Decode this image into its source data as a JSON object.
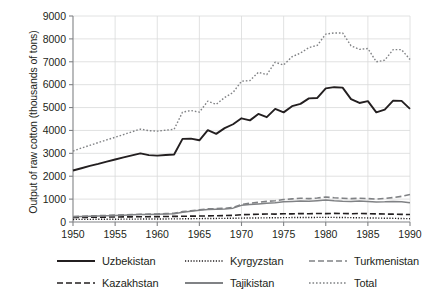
{
  "chart_data": {
    "type": "line",
    "title": "",
    "xlabel": "",
    "ylabel": "Output of raw cotton (thousands of tons)",
    "xlim": [
      1950,
      1990
    ],
    "ylim": [
      0,
      9000
    ],
    "grid": true,
    "legend_position": "bottom",
    "x": [
      1950,
      1951,
      1952,
      1953,
      1954,
      1955,
      1956,
      1957,
      1958,
      1959,
      1960,
      1961,
      1962,
      1963,
      1964,
      1965,
      1966,
      1967,
      1968,
      1969,
      1970,
      1971,
      1972,
      1973,
      1974,
      1975,
      1976,
      1977,
      1978,
      1979,
      1980,
      1981,
      1982,
      1983,
      1984,
      1985,
      1986,
      1987,
      1988,
      1989,
      1990
    ],
    "xticks": [
      1950,
      1955,
      1960,
      1965,
      1970,
      1975,
      1980,
      1985,
      1990
    ],
    "yticks": [
      0,
      1000,
      2000,
      3000,
      4000,
      5000,
      6000,
      7000,
      8000,
      9000
    ],
    "series": [
      {
        "name": "Uzbekistan",
        "style": "solid",
        "color": "#231f20",
        "width": 1.9,
        "values": [
          2250,
          2350,
          2450,
          2540,
          2640,
          2730,
          2820,
          2910,
          3000,
          2920,
          2900,
          2930,
          2950,
          3630,
          3640,
          3570,
          4010,
          3850,
          4100,
          4270,
          4530,
          4440,
          4720,
          4580,
          4940,
          4790,
          5060,
          5160,
          5400,
          5420,
          5840,
          5890,
          5870,
          5370,
          5200,
          5280,
          4790,
          4910,
          5300,
          5290,
          4940
        ]
      },
      {
        "name": "Kazakhstan",
        "style": "dashed",
        "color": "#231f20",
        "width": 1.6,
        "values": [
          195,
          200,
          205,
          210,
          215,
          218,
          222,
          226,
          230,
          232,
          235,
          240,
          245,
          250,
          255,
          260,
          268,
          274,
          282,
          290,
          322,
          330,
          340,
          352,
          345,
          360,
          355,
          368,
          360,
          372,
          366,
          378,
          370,
          362,
          372,
          365,
          355,
          348,
          342,
          335,
          325
        ]
      },
      {
        "name": "Kyrgyzstan",
        "style": "dotted-fine",
        "color": "#231f20",
        "width": 1.4,
        "values": [
          112,
          114,
          116,
          118,
          120,
          122,
          124,
          126,
          128,
          130,
          132,
          134,
          136,
          140,
          144,
          148,
          152,
          156,
          160,
          164,
          170,
          174,
          178,
          182,
          186,
          190,
          194,
          196,
          198,
          200,
          202,
          200,
          196,
          190,
          184,
          178,
          172,
          166,
          160,
          152,
          145
        ]
      },
      {
        "name": "Tajikistan",
        "style": "solid",
        "color": "#808285",
        "width": 1.5,
        "values": [
          228,
          240,
          252,
          264,
          276,
          288,
          300,
          312,
          324,
          330,
          336,
          348,
          362,
          430,
          470,
          510,
          548,
          560,
          572,
          606,
          727,
          760,
          790,
          820,
          840,
          880,
          900,
          920,
          905,
          930,
          960,
          930,
          910,
          900,
          915,
          895,
          870,
          880,
          900,
          885,
          842
        ]
      },
      {
        "name": "Turkmenistan",
        "style": "dashed",
        "color": "#808285",
        "width": 1.6,
        "values": [
          240,
          252,
          264,
          276,
          288,
          300,
          312,
          324,
          336,
          344,
          352,
          366,
          380,
          452,
          492,
          534,
          572,
          584,
          598,
          636,
          766,
          820,
          860,
          900,
          930,
          980,
          1010,
          1040,
          1020,
          1050,
          1090,
          1060,
          1040,
          1020,
          1040,
          1025,
          1000,
          1030,
          1070,
          1120,
          1200
        ]
      },
      {
        "name": "Total",
        "style": "dotted",
        "color": "#808285",
        "width": 1.4,
        "values": [
          3100,
          3230,
          3350,
          3470,
          3590,
          3700,
          3820,
          3940,
          4060,
          3990,
          3970,
          4010,
          4050,
          4800,
          4870,
          4800,
          5280,
          5140,
          5440,
          5660,
          6150,
          6180,
          6540,
          6440,
          6980,
          6860,
          7220,
          7380,
          7620,
          7720,
          8210,
          8260,
          8260,
          7700,
          7540,
          7580,
          7000,
          7070,
          7530,
          7530,
          7100
        ]
      }
    ]
  },
  "legend": {
    "items": [
      {
        "label": "Uzbekistan",
        "style": "solid",
        "color": "#231f20"
      },
      {
        "label": "Kazakhstan",
        "style": "dashed",
        "color": "#231f20"
      },
      {
        "label": "Kyrgyzstan",
        "style": "dotted-fine",
        "color": "#231f20"
      },
      {
        "label": "Tajikistan",
        "style": "solid",
        "color": "#808285"
      },
      {
        "label": "Turkmenistan",
        "style": "dashed",
        "color": "#808285"
      },
      {
        "label": "Total",
        "style": "dotted",
        "color": "#808285"
      }
    ]
  }
}
